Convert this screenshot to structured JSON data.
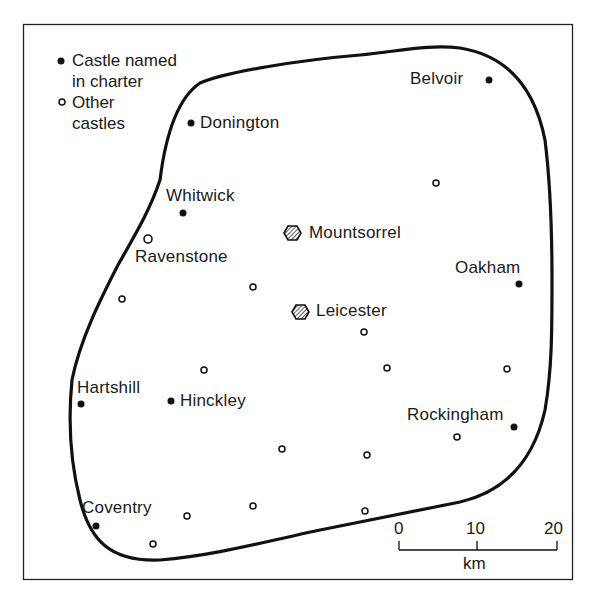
{
  "legend": {
    "named": {
      "line1": "Castle named",
      "line2": "in charter",
      "icon": "filled-dot-icon"
    },
    "other": {
      "line1": "Other",
      "line2": "castles",
      "icon": "open-circle-icon"
    }
  },
  "named_castles": [
    {
      "name": "Belvoir",
      "x": 489,
      "y": 80
    },
    {
      "name": "Donington",
      "x": 191,
      "y": 123
    },
    {
      "name": "Whitwick",
      "x": 183,
      "y": 213
    },
    {
      "name": "Oakham",
      "x": 519,
      "y": 284
    },
    {
      "name": "Hartshill",
      "x": 81,
      "y": 404
    },
    {
      "name": "Hinckley",
      "x": 171,
      "y": 401
    },
    {
      "name": "Rockingham",
      "x": 514,
      "y": 427
    },
    {
      "name": "Coventry",
      "x": 96,
      "y": 526
    }
  ],
  "towns": [
    {
      "name": "Mountsorrel",
      "x": 292,
      "y": 233,
      "icon": "hatched-hexagon-icon"
    },
    {
      "name": "Leicester",
      "x": 300,
      "y": 312,
      "icon": "hatched-hexagon-icon"
    }
  ],
  "other_castles": [
    {
      "name": "Ravenstone",
      "x": 148,
      "y": 239
    },
    {
      "x": 436,
      "y": 183
    },
    {
      "x": 122,
      "y": 299
    },
    {
      "x": 253,
      "y": 287
    },
    {
      "x": 364,
      "y": 332
    },
    {
      "x": 204,
      "y": 370
    },
    {
      "x": 387,
      "y": 368
    },
    {
      "x": 507,
      "y": 369
    },
    {
      "x": 457,
      "y": 437
    },
    {
      "x": 282,
      "y": 449
    },
    {
      "x": 367,
      "y": 455
    },
    {
      "x": 253,
      "y": 506
    },
    {
      "x": 187,
      "y": 516
    },
    {
      "x": 365,
      "y": 511
    },
    {
      "x": 153,
      "y": 544
    }
  ],
  "scale_bar": {
    "ticks": [
      "0",
      "10",
      "20"
    ],
    "unit": "km"
  },
  "colors": {
    "ink": "#1a1a1a",
    "background": "#ffffff"
  }
}
